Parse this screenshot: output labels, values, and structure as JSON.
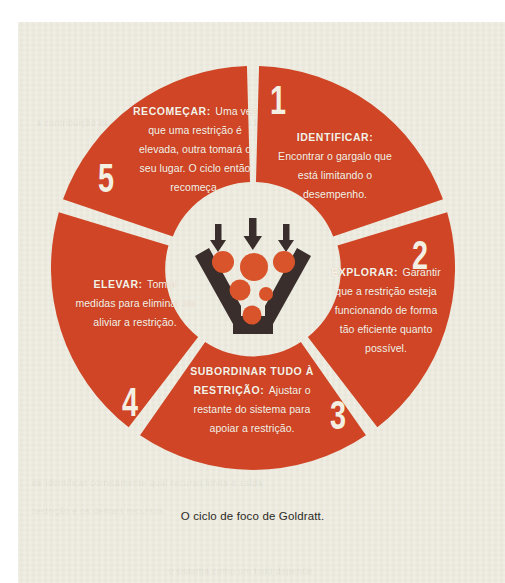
{
  "figure": {
    "caption": "O ciclo de foco de Goldratt.",
    "accent_color": "#cf4526",
    "paper_color": "#eceadd",
    "text_color": "#f6f2e6",
    "icon_color": "#3a2e2c"
  },
  "center_icon": {
    "name": "funnel-bottleneck-icon",
    "arrows": 3,
    "balls": 7
  },
  "segments": [
    {
      "number": "1",
      "heading": "IDENTIFICAR:",
      "body": "Encontrar o gargalo que está limitando o desempenho."
    },
    {
      "number": "2",
      "heading": "EXPLORAR:",
      "body": "Garantir que a restrição esteja funcionando de forma tão eficiente quanto possível."
    },
    {
      "number": "3",
      "heading": "SUBORDINAR TUDO À RESTRIÇÃO:",
      "body": "Ajustar o restante do sistema para apoiar a restrição."
    },
    {
      "number": "4",
      "heading": "ELEVAR:",
      "body": "Tomar medidas para eliminar ou aliviar a restrição."
    },
    {
      "number": "5",
      "heading": "RECOMEÇAR:",
      "body": "Uma vez que uma restrição é elevada, outra tomará o seu lugar. O ciclo então recomeça."
    }
  ],
  "ghost_text": {
    "line1": "a contribuição de cada etapa",
    "line2": "o sistema como um todo depende",
    "line3": "de identificar corretamente qual recurso limita a saída",
    "line4": "restrição e os demais recursos"
  }
}
